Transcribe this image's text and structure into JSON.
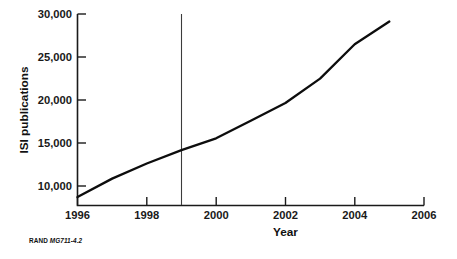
{
  "figure": {
    "credit_prefix": "RAND",
    "credit_id": "MG711-4.2"
  },
  "chart_data": {
    "type": "line",
    "title": "",
    "subtitle": "",
    "xlabel": "Year",
    "ylabel": "ISI publications",
    "x": [
      1996,
      1997,
      1998,
      1999,
      2000,
      2001,
      2002,
      2003,
      2004,
      2005
    ],
    "values": [
      8200,
      10400,
      12200,
      13800,
      15200,
      17300,
      19400,
      22300,
      26400,
      29100
    ],
    "series": [
      {
        "name": "ISI publications",
        "values": [
          8200,
          10400,
          12200,
          13800,
          15200,
          17300,
          19400,
          22300,
          26400,
          29100
        ],
        "color": "#0d0d0d"
      }
    ],
    "xlim": [
      1996,
      2006
    ],
    "ylim": [
      7200,
      30000
    ],
    "xticks": [
      1996,
      1998,
      2000,
      2002,
      2004,
      2006
    ],
    "xticklabels": [
      "1996",
      "1998",
      "2000",
      "2002",
      "2004",
      "2006"
    ],
    "yticks": [
      10000,
      15000,
      20000,
      25000,
      30000
    ],
    "yticklabels": [
      "10,000",
      "15,000",
      "20,000",
      "25,000",
      "30,000"
    ],
    "grid": false,
    "legend": false,
    "legend_position": "none",
    "annotations": [
      {
        "type": "vertical-reference-line",
        "x": 1999,
        "label": "",
        "color": "#3c3c3c"
      }
    ]
  }
}
